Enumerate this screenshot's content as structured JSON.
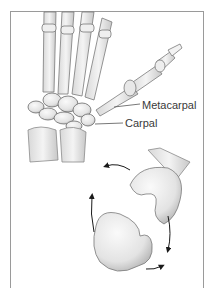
{
  "figure": {
    "labels": {
      "metacarpal": "Metacarpal",
      "carpal": "Carpal"
    },
    "colors": {
      "bone_fill": "#ececec",
      "bone_shade": "#bdbdbd",
      "outline": "#6f6f6f",
      "arrow": "#1a1a1a",
      "frame": "#9a9a9a",
      "label_text": "#3a3a3a"
    }
  }
}
